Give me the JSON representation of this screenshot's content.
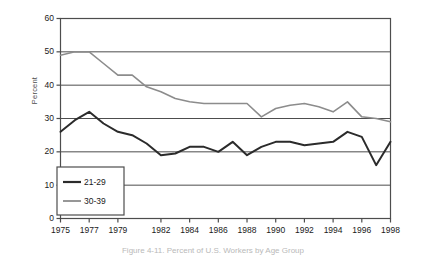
{
  "chart_data": {
    "type": "line",
    "title": "",
    "xlabel": "",
    "ylabel": "Percent",
    "ylim": [
      0,
      60
    ],
    "yticks": [
      0,
      10,
      20,
      30,
      40,
      50,
      60
    ],
    "grid": true,
    "legend_position": "bottom-left",
    "x": [
      1975,
      1976,
      1977,
      1978,
      1979,
      1980,
      1981,
      1982,
      1983,
      1984,
      1985,
      1986,
      1987,
      1988,
      1989,
      1990,
      1991,
      1992,
      1993,
      1994,
      1995,
      1996,
      1997,
      1998
    ],
    "xtick_labels": [
      "1975",
      "1977",
      "1979",
      "1982",
      "1984",
      "1986",
      "1988",
      "1990",
      "1992",
      "1994",
      "1996",
      "1998"
    ],
    "series": [
      {
        "name": "21-29",
        "color": "#2b2b2b",
        "values": [
          26.0,
          29.5,
          32.0,
          28.5,
          26.0,
          25.0,
          22.5,
          19.0,
          19.5,
          21.5,
          21.5,
          20.0,
          23.0,
          19.0,
          21.5,
          23.0,
          23.0,
          22.0,
          22.5,
          23.0,
          26.0,
          24.5,
          16.0,
          23.0
        ]
      },
      {
        "name": "30-39",
        "color": "#8c8c8c",
        "values": [
          49.0,
          50.0,
          50.0,
          46.5,
          43.0,
          43.0,
          39.5,
          38.0,
          36.0,
          35.0,
          34.5,
          34.5,
          34.5,
          34.5,
          30.5,
          33.0,
          34.0,
          34.5,
          33.5,
          32.0,
          35.0,
          30.5,
          30.0,
          29.0
        ]
      }
    ]
  },
  "legend": {
    "items": [
      {
        "label": "21-29"
      },
      {
        "label": "30-39"
      }
    ]
  },
  "caption": {
    "text": "Figure 4-11. Percent of U.S. Workers by Age Group"
  },
  "colors": {
    "series_21_29": "#2b2b2b",
    "series_30_39": "#8c8c8c",
    "axis": "#4d4d4d",
    "grid": "#4d4d4d",
    "background": "#ffffff"
  }
}
